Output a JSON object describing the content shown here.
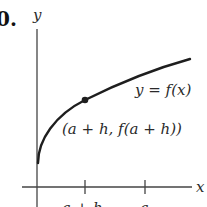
{
  "figure": {
    "problem_number": "0.",
    "y_axis_label": "y",
    "x_axis_label": "x",
    "curve_label": "y = f(x)",
    "point_label": "(a + h, f(a + h))",
    "tick_labels": [
      "a + h",
      "a"
    ],
    "colors": {
      "ink": "#222222",
      "axis": "#444444",
      "background": "#ffffff"
    }
  }
}
